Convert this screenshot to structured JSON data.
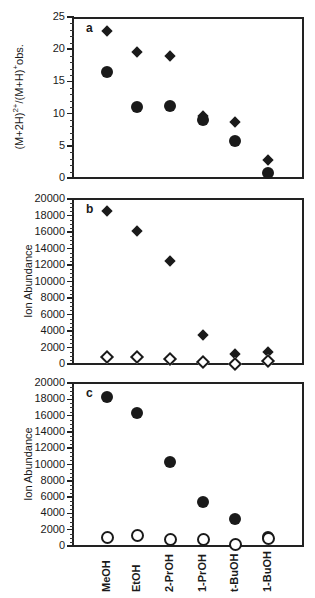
{
  "chart_data": [
    {
      "type": "scatter",
      "panel": "a",
      "title": "",
      "xlabel": "",
      "ylabel": "(M+2H)²⁺/(M+H)⁺obs.",
      "categories": [
        "MeOH",
        "EtOH",
        "2-PrOH",
        "1-PrOH",
        "t-BuOH",
        "1-BuOH"
      ],
      "yticks": [
        0,
        5,
        10,
        15,
        20,
        25
      ],
      "ylim": [
        0,
        25
      ],
      "grid": false,
      "series": [
        {
          "name": "filled diamonds",
          "marker": "filled-diamond",
          "values": [
            22.8,
            19.5,
            19.0,
            9.7,
            8.7,
            2.8
          ]
        },
        {
          "name": "filled circles",
          "marker": "filled-circle",
          "values": [
            16.5,
            11.0,
            11.2,
            9.0,
            5.7,
            0.8
          ]
        }
      ]
    },
    {
      "type": "scatter",
      "panel": "b",
      "ylabel": "Ion Abundance",
      "categories": [
        "MeOH",
        "EtOH",
        "2-PrOH",
        "1-PrOH",
        "t-BuOH",
        "1-BuOH"
      ],
      "yticks": [
        0,
        2000,
        4000,
        6000,
        8000,
        10000,
        12000,
        14000,
        16000,
        18000,
        20000
      ],
      "ylim": [
        0,
        20000
      ],
      "grid": false,
      "series": [
        {
          "name": "filled diamonds",
          "marker": "filled-diamond",
          "values": [
            18500,
            16100,
            12500,
            3500,
            1200,
            1400
          ]
        },
        {
          "name": "open diamonds",
          "marker": "open-diamond",
          "values": [
            800,
            850,
            650,
            300,
            0,
            400
          ]
        }
      ]
    },
    {
      "type": "scatter",
      "panel": "c",
      "ylabel": "Ion Abundance",
      "categories": [
        "MeOH",
        "EtOH",
        "2-PrOH",
        "1-PrOH",
        "t-BuOH",
        "1-BuOH"
      ],
      "yticks": [
        0,
        2000,
        4000,
        6000,
        8000,
        10000,
        12000,
        14000,
        16000,
        18000,
        20000
      ],
      "ylim": [
        0,
        20000
      ],
      "grid": false,
      "series": [
        {
          "name": "filled circles",
          "marker": "filled-circle",
          "values": [
            18300,
            16300,
            10300,
            5400,
            3300,
            1100
          ]
        },
        {
          "name": "open circles",
          "marker": "open-circle",
          "values": [
            1100,
            1400,
            900,
            900,
            300,
            1000
          ]
        }
      ]
    }
  ],
  "panels": {
    "a": {
      "letter": "a",
      "ylabel": "(M+2H)²⁺/(M+H)⁺obs."
    },
    "b": {
      "letter": "b",
      "ylabel": "Ion Abundance"
    },
    "c": {
      "letter": "c",
      "ylabel": "Ion Abundance"
    }
  },
  "xaxis": {
    "categories": [
      "MeOH",
      "EtOH",
      "2-PrOH",
      "1-PrOH",
      "t-BuOH",
      "1-BuOH"
    ]
  }
}
